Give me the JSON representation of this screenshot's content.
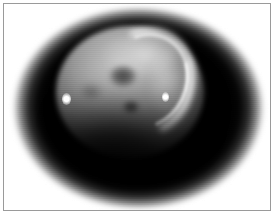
{
  "figure": {
    "caption": "",
    "width_px": 275,
    "height_px": 218,
    "media_type": "grayscale astronomical image",
    "subject": "planetary disk",
    "background_color": "#ffffff",
    "frame_color": "#9a9a9a",
    "frame_inset_px": 3
  },
  "image": {
    "alt_text": "Grayscale telescopic image of a planetary disk showing a bright crescent limb, dark albedo markings and two small bright points, set inside a soft-edged black oval field",
    "vignette": {
      "shape": "ellipse",
      "fill_color": "#000000",
      "edge": "soft-blurred",
      "center_x_px": 135,
      "center_y_px": 104,
      "radius_x_px": 127,
      "radius_y_px": 102
    },
    "disk": {
      "center_x_px": 126,
      "center_y_px": 88,
      "radius_x_px": 74,
      "radius_y_px": 66,
      "peak_brightness": "#c4c4c4",
      "phase": "gibbous",
      "illumination_direction": "upper-right"
    },
    "features": [
      {
        "name": "bright-crescent-arc",
        "type": "limb-arc",
        "brightness": "#ffffff",
        "center_x_px": 141,
        "center_y_px": 78,
        "rotation_deg": 22
      },
      {
        "name": "albedo-spot-major",
        "type": "dark-albedo-feature",
        "center_x_px": 119,
        "center_y_px": 72,
        "width_px": 30,
        "height_px": 24
      },
      {
        "name": "albedo-spot-minor",
        "type": "dark-albedo-feature",
        "center_x_px": 127,
        "center_y_px": 103,
        "width_px": 18,
        "height_px": 14
      },
      {
        "name": "albedo-spot-faint",
        "type": "dark-albedo-feature",
        "center_x_px": 87,
        "center_y_px": 88,
        "width_px": 26,
        "height_px": 20
      },
      {
        "name": "bright-point-west",
        "type": "bright-point-source",
        "center_x_px": 62,
        "center_y_px": 95,
        "brightness": "#ffffff"
      },
      {
        "name": "bright-point-east",
        "type": "bright-point-source",
        "center_x_px": 161,
        "center_y_px": 93,
        "brightness": "#ffffff"
      },
      {
        "name": "terminator-shadow",
        "type": "shadowed-limb",
        "center_x_px": 112,
        "center_y_px": 140
      }
    ]
  }
}
